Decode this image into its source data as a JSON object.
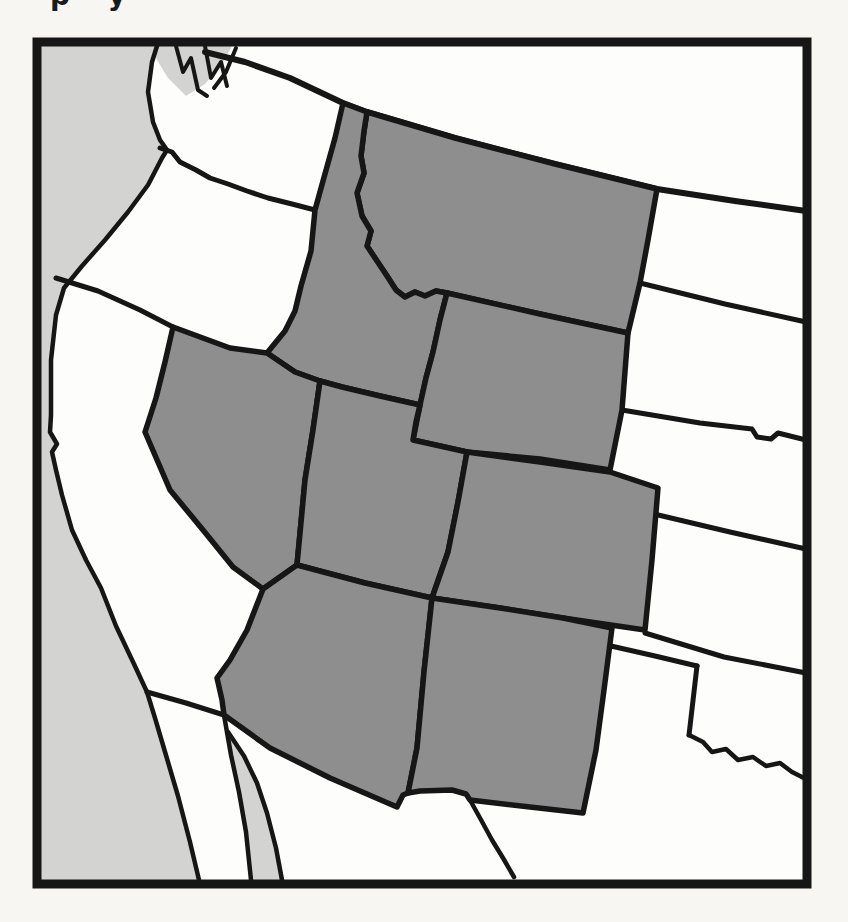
{
  "page": {
    "caption_fragment": "p y"
  },
  "colors": {
    "page_bg": "#f7f6f2",
    "land_white": "#fdfdfb",
    "water_gray": "#d3d3d1",
    "state_gray": "#8e8e8e",
    "line_black": "#161616"
  },
  "map": {
    "frame": {
      "x": 37,
      "y": 42,
      "width": 770,
      "height": 842,
      "stroke_width": 9
    },
    "state_stroke_width": 5.5,
    "waters": [
      {
        "name": "pacific-ocean",
        "points": "41,46 157,46 152,62 148,92 153,122 160,140 167,150 162,158 148,185 128,212 105,240 82,266 64,288 56,315 51,360 51,415 50,432 57,444 52,452 56,470 62,495 72,530 86,560 101,588 116,626 134,664 147,692 155,718 168,762 178,796 190,842 199,880 41,880"
      },
      {
        "name": "gulf-of-california",
        "points": "224,715 231,755 239,792 246,832 251,880 282,880 276,848 267,813 257,783 244,756 228,732"
      },
      {
        "name": "puget-sound",
        "points": "152,46 232,46 222,64 205,84 186,96 168,78 157,60"
      }
    ],
    "shaded_states": [
      {
        "name": "montana",
        "points": "367,112 455,138 555,164 657,189 648,240 640,283 628,333 540,314 447,293 436,291 425,296 415,292 405,297 396,290 387,276 377,261 367,246 371,231 362,216 357,193 364,173 361,156 364,131"
      },
      {
        "name": "idaho",
        "points": "343,103 335,138 323,181 315,210 311,251 301,286 295,311 285,331 267,353 295,372 320,381 342,387 380,396 420,405 426,378 433,352 440,320 447,293 436,291 425,296 415,292 405,297 396,290 387,276 377,261 367,246 371,231 362,216 357,193 364,173 361,156 364,131 367,112"
      },
      {
        "name": "wyoming",
        "points": "447,293 540,314 628,333 622,410 610,470 540,459 467,452 413,440 420,405 426,378 433,352 440,320"
      },
      {
        "name": "nevada",
        "points": "173,327 230,348 267,353 295,372 320,381 313,430 305,480 297,565 263,589 233,567 203,530 170,490 145,432 156,398 165,362"
      },
      {
        "name": "utah",
        "points": "320,381 342,387 380,396 420,405 416,422 413,440 467,452 458,502 448,552 432,598 365,583 297,565 305,480 313,430"
      },
      {
        "name": "colorado",
        "points": "467,452 540,462 610,472 658,488 652,560 645,630 563,618 500,608 432,598 448,552 458,502"
      },
      {
        "name": "arizona",
        "points": "297,565 365,583 432,598 424,672 417,748 408,793 403,795 397,807 330,778 270,748 224,715 222,700 217,678 230,660 247,630 263,589"
      },
      {
        "name": "new-mexico",
        "points": "432,598 500,608 563,618 612,628 604,690 596,750 583,813 530,807 470,800 466,794 452,790 420,791 408,793 417,748 424,672"
      }
    ],
    "borders": [
      {
        "name": "canada-border",
        "width": 6,
        "points": "205,52 245,62 290,78 343,103 367,112 455,138 555,164 657,189 735,201 806,211"
      },
      {
        "name": "washington-oregon-border",
        "width": 5,
        "points": "160,148 172,152 180,162 196,170 210,178 228,184 247,191 268,198 292,204 315,210"
      },
      {
        "name": "oregon-california-border",
        "width": 5,
        "points": "56,278 98,291 140,310 173,327"
      },
      {
        "name": "northdakota-southdakota-border",
        "width": 5,
        "points": "640,283 725,304 806,322"
      },
      {
        "name": "southdakota-nebraska-border",
        "width": 5,
        "points": "622,410 700,423 752,429 757,437 771,439 778,433 806,440"
      },
      {
        "name": "nebraska-kansas-border",
        "width": 5,
        "points": "654,514 730,532 806,549"
      },
      {
        "name": "kansas-oklahoma-border",
        "width": 5,
        "points": "645,633 724,657 806,673"
      },
      {
        "name": "oklahoma-panhandle-south-border",
        "width": 5,
        "points": "611,646 655,656 697,666"
      },
      {
        "name": "texas-oklahoma-west-border",
        "width": 5,
        "points": "697,666 689,735"
      },
      {
        "name": "red-river-border",
        "width": 4.5,
        "points": "689,735 703,742 712,752 726,749 738,760 753,757 766,766 780,763 792,772 806,779"
      },
      {
        "name": "rio-grande-border",
        "width": 4.5,
        "points": "470,800 480,818 492,840 503,858 514,877"
      },
      {
        "name": "california-mexico-border",
        "width": 5,
        "points": "147,692 186,703 224,715"
      },
      {
        "name": "pacific-coastline",
        "width": 4.5,
        "points": "157,46 152,62 148,92 153,122 160,140 167,150 162,158 148,185 128,212 105,240 82,266 64,288 56,315 51,360 51,415 50,432 57,444 52,452 56,470 62,495 72,530 86,560 101,588 116,626 134,664 147,692 155,718 168,762 178,796 190,842 199,880"
      },
      {
        "name": "baja-east-coastline",
        "width": 4.5,
        "points": "224,715 231,755 239,792 246,832 251,880"
      },
      {
        "name": "sonora-coastline",
        "width": 4.5,
        "points": "228,732 244,756 257,783 267,813 276,848 282,880"
      },
      {
        "name": "puget-sound-inlet-1",
        "width": 4,
        "points": "176,46 183,72 191,58 198,90 207,96"
      },
      {
        "name": "puget-sound-inlet-2",
        "width": 4,
        "points": "205,46 211,78 221,62 227,86"
      },
      {
        "name": "puget-sound-inlet-3",
        "width": 4,
        "points": "236,48 226,72 214,88"
      }
    ]
  }
}
